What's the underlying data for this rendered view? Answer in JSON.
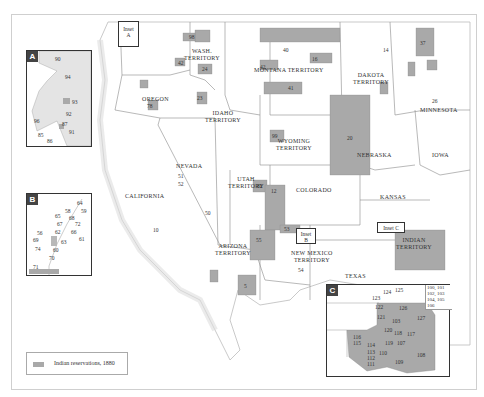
{
  "map": {
    "legend": {
      "label": "Indian reservations, 1880",
      "swatch_color": "#a9a9a9"
    },
    "colors": {
      "reservation": "#a9a9a9",
      "land": "#ffffff",
      "border": "#888888",
      "frame": "#cfcfcf",
      "inset_tag": "#444444"
    },
    "regions": [
      {
        "label": "WASH.",
        "label2": "TERRITORY"
      },
      {
        "label": "OREGON"
      },
      {
        "label": "IDAHO",
        "label2": "TERRITORY"
      },
      {
        "label": "MONTANA TERRITORY"
      },
      {
        "label": "DAKOTA",
        "label2": "TERRITORY"
      },
      {
        "label": "MINNESOTA"
      },
      {
        "label": "WYOMING",
        "label2": "TERRITORY"
      },
      {
        "label": "NEBRASKA"
      },
      {
        "label": "IOWA"
      },
      {
        "label": "NEVADA"
      },
      {
        "label": "UTAH",
        "label2": "TERRITORY"
      },
      {
        "label": "COLORADO"
      },
      {
        "label": "KANSAS"
      },
      {
        "label": "CALIFORNIA"
      },
      {
        "label": "ARIZONA",
        "label2": "TERRITORY"
      },
      {
        "label": "NEW MEXICO",
        "label2": "TERRITORY"
      },
      {
        "label": "TEXAS"
      },
      {
        "label": "INDIAN",
        "label2": "TERRITORY"
      }
    ],
    "inset_markers": [
      {
        "label": "Inset",
        "label2": "A"
      },
      {
        "label": "Inset",
        "label2": "B"
      },
      {
        "label": "Inset C"
      }
    ],
    "insets": {
      "A": {
        "tag": "A",
        "numbers": [
          "90",
          "94",
          "93",
          "92",
          "96",
          "87",
          "91",
          "85",
          "86"
        ]
      },
      "B": {
        "tag": "B",
        "numbers": [
          "64",
          "58",
          "59",
          "65",
          "68",
          "67",
          "72",
          "56",
          "62",
          "66",
          "61",
          "69",
          "63",
          "74",
          "60",
          "70",
          "71"
        ]
      },
      "C": {
        "tag": "C",
        "numbers": [
          "124",
          "125",
          "123",
          "122",
          "126",
          "121",
          "103",
          "127",
          "120",
          "118",
          "117",
          "116",
          "115",
          "114",
          "119",
          "107",
          "113",
          "110",
          "108",
          "112",
          "111",
          "109"
        ],
        "list": "100, 101 102, 103 104, 105 106"
      }
    },
    "reservation_numbers": {
      "wash": [
        "85",
        "95",
        "88",
        "83",
        "98",
        "84",
        "97",
        "22",
        "24"
      ],
      "oregon": [
        "79",
        "76",
        "81",
        "80",
        "77",
        "78",
        "73"
      ],
      "idaho": [
        "25",
        "23",
        "49"
      ],
      "montana": [
        "42",
        "40",
        "41"
      ],
      "dakota": [
        "16",
        "14",
        "17",
        "18",
        "13",
        "20",
        "21",
        "19"
      ],
      "minnesota": [
        "37",
        "32",
        "34",
        "39",
        "33",
        "35",
        "36",
        "38",
        "15"
      ],
      "wyoming": [
        "99"
      ],
      "nebraska": [
        "44",
        "48",
        "45"
      ],
      "iowa": [
        "26"
      ],
      "kansas": [
        "47",
        "43",
        "46",
        "29",
        "31",
        "27",
        "28",
        "30"
      ],
      "nevada": [
        "51",
        "52",
        "50"
      ],
      "utah": [
        "82",
        "55"
      ],
      "colorado": [
        "12",
        "53"
      ],
      "california": [
        "10",
        "8"
      ],
      "arizona": [
        "6",
        "3",
        "1",
        "2",
        "5",
        "4",
        "75"
      ],
      "newmexico": [
        "73",
        "57",
        "54"
      ]
    }
  }
}
